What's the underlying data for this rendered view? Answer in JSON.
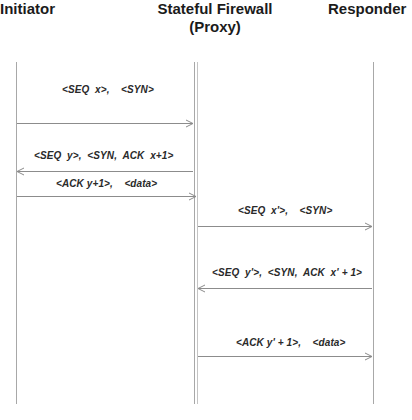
{
  "actors": {
    "initiator": "Initiator",
    "firewall_line1": "Stateful Firewall",
    "firewall_line2": "(Proxy)",
    "responder": "Responder"
  },
  "messages": [
    {
      "label": "<SEQ  x>,    <SYN>",
      "from": "Initiator",
      "to": "Stateful Firewall",
      "direction": "right"
    },
    {
      "label": "<SEQ  y>,  <SYN,  ACK  x+1>",
      "from": "Stateful Firewall",
      "to": "Initiator",
      "direction": "left"
    },
    {
      "label": "<ACK y+1>,    <data>",
      "from": "Initiator",
      "to": "Stateful Firewall",
      "direction": "right"
    },
    {
      "label": "<SEQ  x'>,    <SYN>",
      "from": "Stateful Firewall",
      "to": "Responder",
      "direction": "right"
    },
    {
      "label": "<SEQ  y'>,  <SYN,  ACK  x' + 1>",
      "from": "Responder",
      "to": "Stateful Firewall",
      "direction": "left"
    },
    {
      "label": "<ACK y' + 1>,    <data>",
      "from": "Stateful Firewall",
      "to": "Responder",
      "direction": "right"
    }
  ],
  "colors": {
    "line": "#a8a8a8",
    "arrow": "#8c8c8c",
    "text": "#1b1b1b"
  }
}
